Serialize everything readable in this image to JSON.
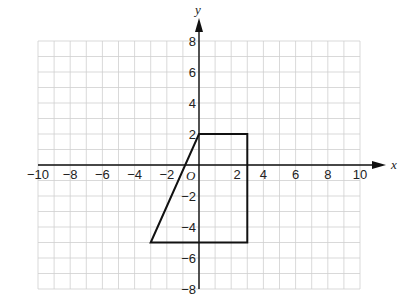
{
  "diagram": {
    "type": "coordinate-grid",
    "x_axis": {
      "label": "x",
      "min": -10,
      "max": 10,
      "tick_step": 2,
      "tick_labels": [
        "−10",
        "−8",
        "−6",
        "−4",
        "−2",
        "2",
        "4",
        "6",
        "8",
        "10"
      ]
    },
    "y_axis": {
      "label": "y",
      "min": -8,
      "max": 8,
      "tick_step": 2,
      "tick_labels": [
        "8",
        "6",
        "4",
        "2",
        "−2",
        "−4",
        "−6",
        "−8"
      ]
    },
    "origin_label": "O",
    "grid": {
      "minor_step": 1,
      "color": "#cfcfcf"
    },
    "shape": {
      "name": "trapezium",
      "vertices": [
        [
          -3,
          -5
        ],
        [
          0,
          2
        ],
        [
          3,
          2
        ],
        [
          3,
          -5
        ]
      ],
      "stroke": "#111111"
    }
  }
}
